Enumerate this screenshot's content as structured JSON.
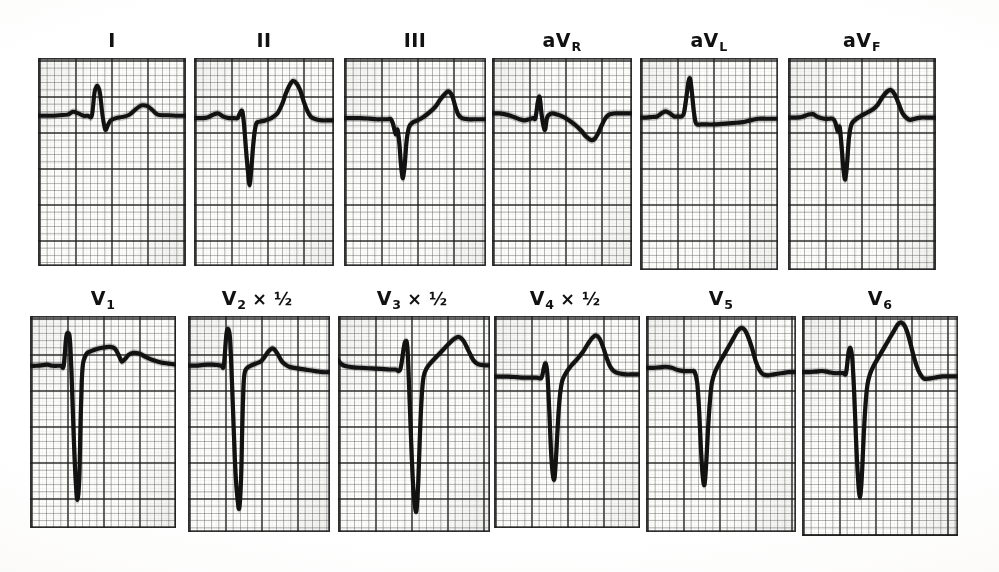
{
  "figure": {
    "kind": "12-lead electrocardiogram tracing",
    "rows": 2,
    "columns": 6,
    "paper": {
      "background_hex": "#fdfdfb",
      "page_hex": "#ffffff",
      "fine_grid_hex": "#4a4a4a",
      "bold_grid_hex": "#1c1c1c",
      "trace_hex": "#121212",
      "small_box_px": 7.2,
      "boxes_per_bold": 5
    }
  },
  "chart_data": {
    "type": "line",
    "title": "",
    "xlabel": "",
    "ylabel": "",
    "paper_speed": "25 mm/s",
    "standardization": "10 mm/mV (leads V2, V3, V4 at 5 mm/mV)",
    "grid": "on",
    "legend_position": "above each panel",
    "leads": [
      {
        "id": "I",
        "label_text": "I",
        "label_base": "I",
        "label_sub": "",
        "scale_note": "",
        "row": 1,
        "column": 1,
        "qrs_morphology": "small rS with notched upright T",
        "baseline_mm": 0,
        "r_wave_mm": 5.5,
        "s_wave_mm": -3.5,
        "t_wave_mm": 2.0,
        "points": "0,50 10,50 20,50 32,49.5 44,49 52,46.5 60,48 68,50 74,50 80,50 84,30 88,24 92,30 96,50 100,62 104,58 108,54 116,52 126,51 136,49 146,44 154,41 162,41.5 170,45 178,49 190,49.5 205,50 220,50"
      },
      {
        "id": "II",
        "label_text": "II",
        "label_base": "II",
        "label_sub": "",
        "scale_note": "",
        "row": 1,
        "column": 2,
        "qrs_morphology": "deep narrow QS, tall peaked T",
        "baseline_mm": 0,
        "r_wave_mm": 0.5,
        "s_wave_mm": -12.0,
        "t_wave_mm": 8.5,
        "points": "0,52 12,52 22,51.5 32,49 40,48 48,50.5 58,52 66,52 72,52 76,48 80,46 83,58 86,78 89,96 92,110 95,96 98,76 101,62 104,56 110,55 118,54 128,52 138,48 146,40 152,31 158,24 164,20 170,22 176,28 182,38 188,46 194,51 202,53 212,54 222,54 232,54"
      },
      {
        "id": "III",
        "label_text": "III",
        "label_base": "III",
        "label_sub": "",
        "scale_note": "",
        "row": 1,
        "column": 3,
        "qrs_morphology": "deep narrow QS, upright peaked T",
        "baseline_mm": 0,
        "r_wave_mm": 0.5,
        "s_wave_mm": -10.5,
        "t_wave_mm": 6.5,
        "points": "0,52 14,52 28,52 42,52.5 54,53 64,53 72,53 78,53 82,58 86,66 89,62 92,74 95,94 98,104 101,92 104,72 108,60 114,56 122,54 132,51 142,47 152,42 160,36 168,31 174,29 180,33 185,42 190,49 196,52 206,53 216,53 226,53 236,53"
      },
      {
        "id": "aVR",
        "label_text": "aVR",
        "label_base": "aV",
        "label_sub": "R",
        "scale_note": "",
        "row": 1,
        "column": 4,
        "qrs_morphology": "small sharp biphasic spike, inverted T",
        "baseline_mm": 0,
        "r_wave_mm": 3.0,
        "s_wave_mm": -2.0,
        "t_wave_mm": -4.0,
        "points": "0,48 12,48 24,49 36,51 46,53 54,54 62,53 68,52 72,52 76,38 79,34 82,48 85,58 88,62 91,52 95,49 100,48 108,49 118,51 128,54 138,58 148,63 156,68 164,71 170,70 176,65 182,58 188,52 194,49 202,48 212,48 222,48 232,48"
      },
      {
        "id": "aVL",
        "label_text": "aVL",
        "label_base": "aV",
        "label_sub": "L",
        "scale_note": "",
        "row": 1,
        "column": 5,
        "qrs_morphology": "tall sharp R, flat depressed ST segment",
        "baseline_mm": 0,
        "r_wave_mm": 9.0,
        "s_wave_mm": -0.5,
        "t_wave_mm": 0.5,
        "points": "0,52 10,52 20,51.5 28,51 36,48 42,46.5 48,48 56,51 62,51 68,51 72,48 76,34 79,22 82,18 85,30 88,46 91,56 94,58 100,58 110,58 122,58 134,57.5 146,57 158,56.5 168,56 176,55 184,54 194,53 206,53 216,53 226,53"
      },
      {
        "id": "aVF",
        "label_text": "aVF",
        "label_base": "aV",
        "label_sub": "F",
        "scale_note": "",
        "row": 1,
        "column": 6,
        "qrs_morphology": "deep narrow QS, upright rounded T",
        "baseline_mm": 0,
        "r_wave_mm": 0.5,
        "s_wave_mm": -11.0,
        "t_wave_mm": 6.0,
        "points": "0,52 12,52 22,51.5 32,49.5 40,49 48,51.5 58,53 66,53 72,53 76,56 80,64 83,60 86,76 89,96 92,106 95,92 98,70 102,58 108,54 116,51 126,48 136,45 144,41 152,34 160,29 166,28 172,32 178,40 184,48 190,52 196,54 204,53 214,52 226,52 238,52"
      },
      {
        "id": "V1",
        "label_text": "V1",
        "label_base": "V",
        "label_sub": "1",
        "scale_note": "",
        "row": 2,
        "column": 1,
        "qrs_morphology": "tall sharp R with very deep S (rS), notched upright T",
        "baseline_mm": 0,
        "r_wave_mm": 8.0,
        "s_wave_mm": -23.0,
        "t_wave_mm": 2.5,
        "points": "0,46 10,46 20,45.5 28,45 36,46 44,46 50,46 54,46 58,20 61,16 64,22 67,60 70,110 73,150 76,170 79,150 81,100 83,60 85,44 88,38 92,34 100,32 110,30 120,29 128,28.5 136,30 142,36 147,42 152,40 158,36 166,34 176,35 186,38 198,41 210,43 222,44 234,45"
      },
      {
        "id": "V2",
        "label_text": "V2 × ½",
        "label_base": "V",
        "label_sub": "2",
        "scale_note": "× ½",
        "row": 2,
        "column": 2,
        "qrs_morphology": "tall R off scale with very deep S, half standardization",
        "baseline_mm": 0,
        "r_wave_mm": 17.0,
        "s_wave_mm": -24.0,
        "t_wave_mm": 3.0,
        "points": "0,46 12,46 22,45.5 32,45 40,45 48,45.5 54,46 58,46 62,18 65,12 68,20 71,58 74,104 77,146 80,168 83,178 86,150 88,100 90,64 92,52 96,48 102,46 110,44 118,42 124,38 130,33 136,30 140,31 146,36 152,42 158,45 164,47 172,48 182,49 194,50 206,51 218,52 230,52"
      },
      {
        "id": "V3",
        "label_text": "V3 × ½",
        "label_base": "V",
        "label_sub": "3",
        "scale_note": "× ½",
        "row": 2,
        "column": 3,
        "qrs_morphology": "very deep S with tall peaked T, half standardization",
        "baseline_mm": 0,
        "r_wave_mm": 9.0,
        "s_wave_mm": -26.0,
        "t_wave_mm": 7.0,
        "points": "0,42 6,46 14,48 26,49 40,49.5 56,50 72,50.5 86,51 96,51 104,51 110,30 113,24 116,30 119,70 122,116 125,156 128,178 131,186 134,160 137,112 140,76 143,58 148,50 156,44 166,38 176,32 186,26 194,22 202,20 210,24 218,33 226,42 234,46 244,47 254,47"
      },
      {
        "id": "V4",
        "label_text": "V4 × ½",
        "label_base": "V",
        "label_sub": "4",
        "scale_note": "× ½",
        "row": 2,
        "column": 4,
        "qrs_morphology": "deep narrow S with tall peaked T, half standardization",
        "baseline_mm": 0,
        "r_wave_mm": 2.0,
        "s_wave_mm": -19.0,
        "t_wave_mm": 9.5,
        "points": "0,56 12,56 24,56 38,56.5 50,57 62,57 72,57 80,57 84,48 87,44 90,54 93,86 96,124 99,146 102,150 105,126 108,96 111,74 115,60 122,52 130,46 140,40 150,33 158,26 166,20 172,18 178,21 184,29 190,39 196,47 202,51 210,53 222,54 234,54 246,54"
      },
      {
        "id": "V5",
        "label_text": "V5",
        "label_base": "V",
        "label_sub": "5",
        "scale_note": "",
        "row": 2,
        "column": 5,
        "qrs_morphology": "deep narrow S with very tall peaked T",
        "baseline_mm": 0,
        "r_wave_mm": 1.5,
        "s_wave_mm": -21.0,
        "t_wave_mm": 13.5,
        "points": "0,48 12,48 22,47.5 32,47 42,48 52,50 62,51 70,51 76,51 80,52 84,62 87,86 90,122 93,148 96,156 99,134 102,102 105,78 108,62 113,52 120,44 128,36 136,28 144,20 150,14 156,11 162,13 168,20 174,30 180,42 186,50 192,54 200,55 210,54 222,53 234,52 246,52"
      },
      {
        "id": "V6",
        "label_text": "V6",
        "label_base": "V",
        "label_sub": "6",
        "scale_note": "",
        "row": 2,
        "column": 6,
        "qrs_morphology": "small r, deep S, very tall peaked T",
        "baseline_mm": 0,
        "r_wave_mm": 4.5,
        "s_wave_mm": -22.0,
        "t_wave_mm": 15.0,
        "points": "0,52 12,52 22,51.5 32,51 42,52 52,53 60,53 66,53 70,53 74,34 77,30 80,40 83,72 86,116 89,150 92,168 95,150 98,112 101,82 104,64 108,54 114,46 122,38 130,30 138,22 146,14 152,8 158,6 164,10 170,20 176,34 182,46 188,54 194,58 202,58 212,57 224,56 236,56 248,56"
      }
    ]
  },
  "panels": {
    "I": {
      "w": 148,
      "h": 208,
      "trace_vb": "0 0 220 180",
      "stroke": 4.0
    },
    "II": {
      "w": 140,
      "h": 208,
      "trace_vb": "0 0 232 180",
      "stroke": 4.2
    },
    "III": {
      "w": 142,
      "h": 208,
      "trace_vb": "0 0 236 180",
      "stroke": 4.2
    },
    "aVR": {
      "w": 140,
      "h": 208,
      "trace_vb": "0 0 232 180",
      "stroke": 4.2
    },
    "aVL": {
      "w": 138,
      "h": 212,
      "trace_vb": "0 0 226 185",
      "stroke": 4.2
    },
    "aVF": {
      "w": 148,
      "h": 212,
      "trace_vb": "0 0 238 185",
      "stroke": 4.2
    },
    "V1": {
      "w": 146,
      "h": 212,
      "trace_vb": "0 0 234 196",
      "stroke": 4.2
    },
    "V2": {
      "w": 142,
      "h": 216,
      "trace_vb": "0 0 230 200",
      "stroke": 4.2
    },
    "V3": {
      "w": 152,
      "h": 216,
      "trace_vb": "0 0 254 206",
      "stroke": 4.2
    },
    "V4": {
      "w": 146,
      "h": 212,
      "trace_vb": "0 0 246 196",
      "stroke": 4.2
    },
    "V5": {
      "w": 150,
      "h": 216,
      "trace_vb": "0 0 246 200",
      "stroke": 4.2
    },
    "V6": {
      "w": 156,
      "h": 220,
      "trace_vb": "0 0 248 204",
      "stroke": 4.2
    }
  },
  "layout": {
    "row1_gaps": [
      38,
      8,
      10,
      6,
      8,
      10
    ],
    "row2_gaps": [
      30,
      12,
      8,
      4,
      6,
      6
    ]
  }
}
